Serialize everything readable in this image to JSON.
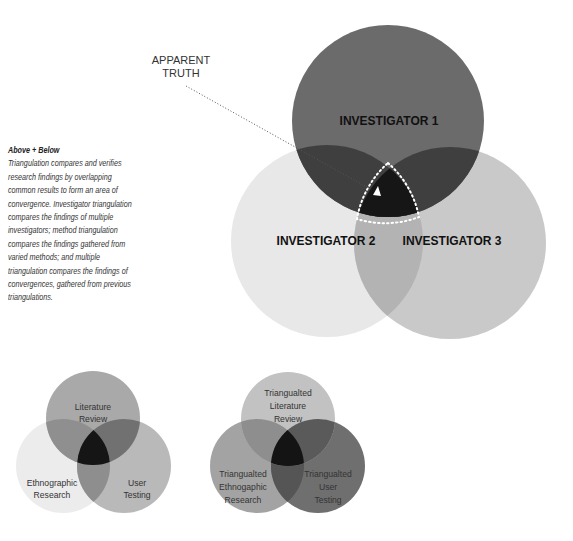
{
  "description": {
    "title": "Above + Below",
    "body": "Triangulation compares and verifies research findings by overlapping common results to form an area of convergence. Investigator triangulation compares the findings of multiple investigators; method triangulation compares the findings gathered from varied methods; and multiple triangulation compares the findings of convergences, gathered from previous triangulations."
  },
  "main_diagram": {
    "annotation_line1": "APPARENT",
    "annotation_line2": "TRUTH",
    "circles": [
      {
        "label": "INVESTIGATOR 1",
        "color": "#6b6b6b"
      },
      {
        "label": "INVESTIGATOR 2",
        "color": "#e8e8e8"
      },
      {
        "label": "INVESTIGATOR 3",
        "color": "#c9c9c9"
      }
    ],
    "overlap_color": "#3f3f3f",
    "convergence_color": "#161616"
  },
  "method_diagram": {
    "circles": [
      {
        "line1": "Literature",
        "line2": "Review"
      },
      {
        "line1": "Ethnographic",
        "line2": "Research"
      },
      {
        "line1": "User",
        "line2": "Testing"
      }
    ]
  },
  "multiple_diagram": {
    "circles": [
      {
        "line1": "Triangualted",
        "line2": "Literature",
        "line3": "Review"
      },
      {
        "line1": "Triangualted",
        "line2": "Ethnogaphic",
        "line3": "Research"
      },
      {
        "line1": "Triangualted",
        "line2": "User",
        "line3": "Testing"
      }
    ]
  }
}
